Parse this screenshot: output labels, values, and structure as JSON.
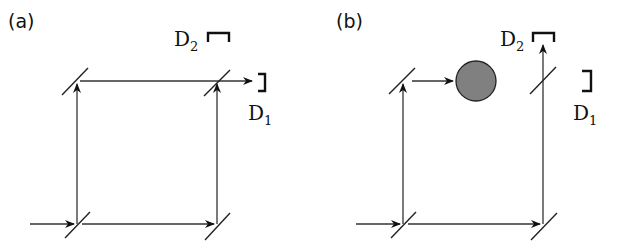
{
  "panels": [
    {
      "label": "(a)",
      "detectors": {
        "d1": "D",
        "d1_sub": "1",
        "d2": "D",
        "d2_sub": "2"
      },
      "obstacle": false
    },
    {
      "label": "(b)",
      "detectors": {
        "d1": "D",
        "d1_sub": "1",
        "d2": "D",
        "d2_sub": "2"
      },
      "obstacle": true
    }
  ],
  "colors": {
    "obstacle_fill": "#808080",
    "line": "#333333"
  }
}
